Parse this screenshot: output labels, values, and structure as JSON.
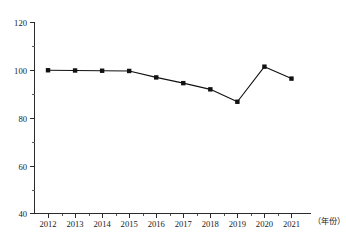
{
  "chart_data": {
    "type": "line",
    "title": "",
    "xlabel": "（年份）",
    "ylabel": "",
    "categories": [
      "2012",
      "2013",
      "2014",
      "2015",
      "2016",
      "2017",
      "2018",
      "2019",
      "2020",
      "2021"
    ],
    "values": [
      100.0,
      99.9,
      99.8,
      99.7,
      97.0,
      94.6,
      92.0,
      86.8,
      101.5,
      96.5
    ],
    "series": [
      {
        "name": "",
        "values": [
          100.0,
          99.9,
          99.8,
          99.7,
          97.0,
          94.6,
          92.0,
          86.8,
          101.5,
          96.5
        ]
      }
    ],
    "ylim": [
      40,
      120
    ],
    "ytick_labels": [
      "120",
      "100",
      "80",
      "60",
      "40"
    ],
    "ytick_values": [
      120,
      100,
      80,
      60,
      40
    ],
    "yminor_values": [
      110,
      90,
      70,
      50
    ],
    "xlim_labels": [
      "2012",
      "2021"
    ],
    "grid": false,
    "legend": null,
    "marker": "square",
    "line_color": "#111111",
    "marker_color": "#111111",
    "axis_color": "#2b2b2b",
    "background_color": "#ffffff"
  },
  "axis_title": {
    "x_unit_label": "（年份）"
  }
}
